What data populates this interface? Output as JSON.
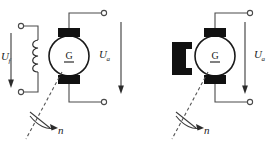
{
  "figure": {
    "background_color": "#ffffff",
    "line_color": "#4a4a4a",
    "fill_color": "#111111"
  },
  "diagrams": [
    {
      "id": "separately-excited-generator",
      "machine_symbol": "G",
      "field_type": "wound-field-coil",
      "labels": {
        "field_voltage": "U",
        "field_voltage_subscript": "f",
        "armature_voltage": "U",
        "armature_voltage_subscript": "a",
        "speed": "n"
      },
      "terminals": 4
    },
    {
      "id": "permanent-magnet-generator",
      "machine_symbol": "G",
      "field_type": "permanent-magnet",
      "labels": {
        "armature_voltage": "U",
        "armature_voltage_subscript": "a",
        "speed": "n"
      },
      "terminals": 2
    }
  ]
}
